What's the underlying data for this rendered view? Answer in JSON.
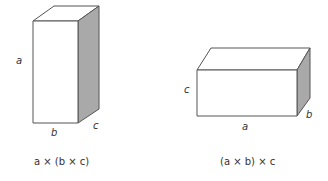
{
  "diagram": {
    "colors": {
      "stroke": "#555555",
      "side_shade": "#a9a9a9",
      "face": "#ffffff",
      "text": "#333333"
    },
    "left_box": {
      "label_height": "a",
      "label_width": "b",
      "label_depth": "c",
      "caption": "a × (b × c)"
    },
    "right_box": {
      "label_height": "c",
      "label_width": "a",
      "label_depth": "b",
      "caption": "(a × b) × c"
    }
  }
}
